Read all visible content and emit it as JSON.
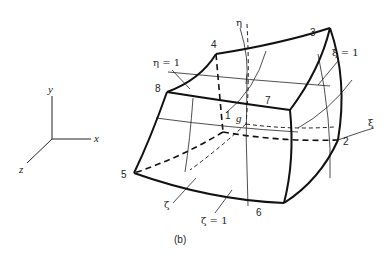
{
  "figure": {
    "caption": "(b)",
    "axes": {
      "x_label": "x",
      "y_label": "y",
      "z_label": "z"
    },
    "nodes": [
      {
        "id": "1",
        "label": "1"
      },
      {
        "id": "2",
        "label": "2"
      },
      {
        "id": "3",
        "label": "3"
      },
      {
        "id": "4",
        "label": "4"
      },
      {
        "id": "5",
        "label": "5"
      },
      {
        "id": "6",
        "label": "6"
      },
      {
        "id": "7",
        "label": "7"
      },
      {
        "id": "8",
        "label": "8"
      }
    ],
    "center_label": "g",
    "natural_axes": {
      "xi": "ξ",
      "eta": "η",
      "zeta": "ζ"
    },
    "face_labels": {
      "eta_face": "η = 1",
      "xi_face": "ξ = 1",
      "zeta_face": "ζ = 1"
    }
  }
}
